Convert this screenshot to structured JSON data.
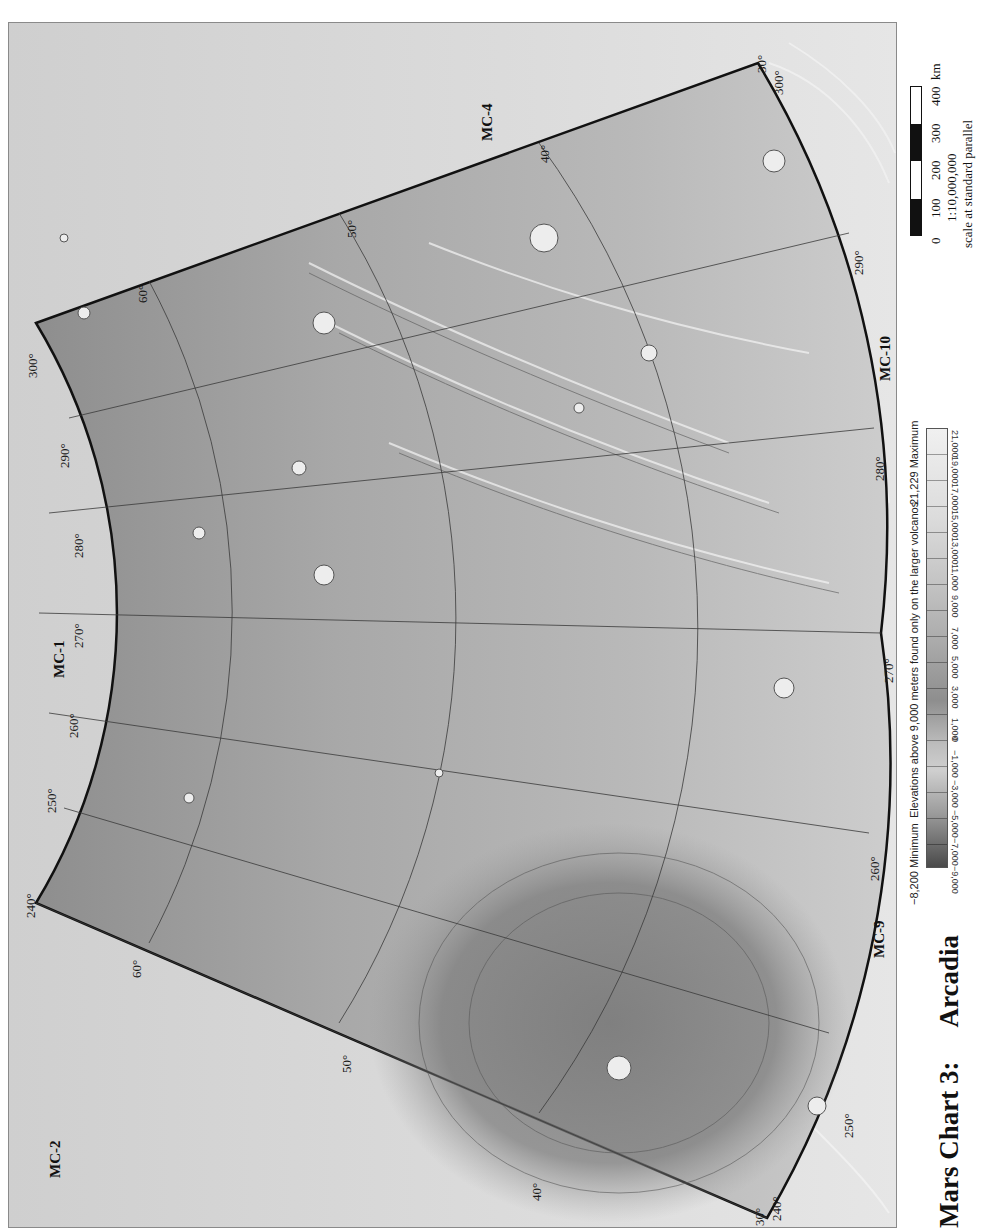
{
  "title": {
    "chart": "Mars Chart 3:",
    "name": "Arcadia"
  },
  "map": {
    "adjacent_charts": {
      "top": "MC-4",
      "left": "MC-1",
      "bottom_left": "MC-2",
      "right_upper": "MC-10",
      "right_lower": "MC-9"
    },
    "longitude_labels_inner_arc": [
      "240°",
      "250°",
      "260°",
      "270°",
      "280°",
      "290°",
      "300°"
    ],
    "longitude_labels_outer_arc": [
      "240°",
      "250°",
      "260°",
      "270°",
      "280°",
      "290°",
      "300°"
    ],
    "latitude_labels": [
      "30°",
      "40°",
      "50°",
      "60°"
    ],
    "corner_labels": {
      "top_right": [
        "30°",
        "300°"
      ],
      "bottom_right": [
        "30°",
        "240°"
      ],
      "top_left": "300°",
      "bottom_left": "240°"
    },
    "colors": {
      "background": "#d9d9d9",
      "sector_fill": "#a6a6a6",
      "sector_dark": "#7a7a7a",
      "outline": "#111111",
      "graticule": "#3a3a3a"
    }
  },
  "legend": {
    "minimum": "−8,200 Minimum",
    "maximum": "21,229 Maximum",
    "note": "Elevations above 9,000 meters found only on the larger volcanos",
    "ticks": [
      "−9,000",
      "−7,000",
      "−5,000",
      "−3,000",
      "−1,000",
      "0",
      "1,000",
      "3,000",
      "5,000",
      "7,000",
      "9,000",
      "11,000",
      "13,000",
      "15,000",
      "17,000",
      "19,000",
      "21,000"
    ]
  },
  "scale_bar": {
    "ticks": [
      "0",
      "100",
      "200",
      "300",
      "400"
    ],
    "unit": "km",
    "ratio": "1:10,000,000",
    "note": "scale at standard parallel"
  }
}
